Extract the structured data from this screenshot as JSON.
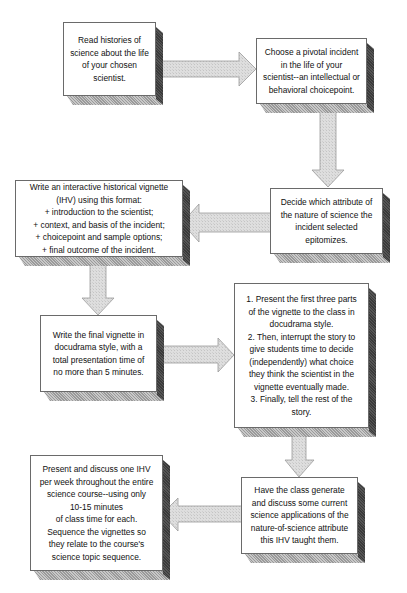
{
  "flowchart": {
    "colors": {
      "box_face": "#ffffff",
      "box_side": "#3a3a3a",
      "box_bottom": "#b0b0b0",
      "arrow_fill": "#d8d8d8"
    },
    "steps": [
      {
        "id": 1,
        "text": "Read histories of\nscience about the life\nof  your chosen\nscientist."
      },
      {
        "id": 2,
        "text": "Choose a pivotal incident\nin the life of your\nscientist--an intellectual or\nbehavioral choicepoint."
      },
      {
        "id": 3,
        "text": "Decide which attribute of\nthe nature of science the\nincident selected\nepitomizes."
      },
      {
        "id": 4,
        "text": "Write an interactive historical  vignette\n(IHV) using this format:\n+ introduction to the scientist;\n+ context, and basis of the incident;\n+ choicepoint and sample options;\n+  final outcome of the incident."
      },
      {
        "id": 5,
        "text": "Write the final vignette in\ndocudrama style, with a\ntotal presentation time of\nno more than 5 minutes."
      },
      {
        "id": 6,
        "text": "1. Present the first three parts\nof the vignette to the class in\ndocudrama style.\n2. Then, interrupt the story to\ngive students  time to decide\n(independently) what choice\nthey think the scientist in the\nvignette eventually made.\n3. Finally, tell the rest of the\nstory."
      },
      {
        "id": 7,
        "text": "Have the class generate\nand discuss some current\nscience applications of the\nnature-of-science attribute\nthis IHV taught them."
      },
      {
        "id": 8,
        "text": "Present and discuss one IHV\nper week throughout the entire\nscience course--using only\n10-15 minutes\nof class time for each.\nSequence the vignettes so\nthey  relate to the course's\nscience topic sequence."
      }
    ],
    "arrows": [
      {
        "from": 1,
        "to": 2,
        "direction": "right"
      },
      {
        "from": 2,
        "to": 3,
        "direction": "down"
      },
      {
        "from": 3,
        "to": 4,
        "direction": "left"
      },
      {
        "from": 4,
        "to": 5,
        "direction": "down"
      },
      {
        "from": 5,
        "to": 6,
        "direction": "right"
      },
      {
        "from": 6,
        "to": 7,
        "direction": "down"
      },
      {
        "from": 7,
        "to": 8,
        "direction": "left"
      }
    ]
  }
}
